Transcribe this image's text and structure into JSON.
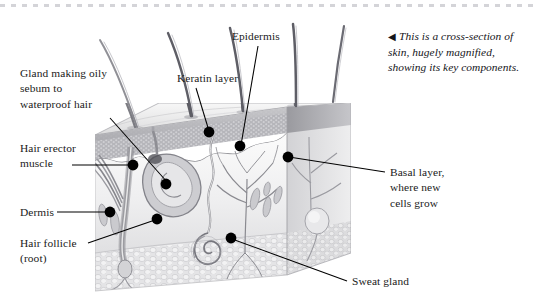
{
  "figure": {
    "title": "Cross-section of skin",
    "caption": {
      "arrow": "◀",
      "text": "This is a cross-section of skin, hugely magnified, showing its key components."
    },
    "labels": [
      {
        "id": "gland-sebum",
        "text": "Gland making oily\nsebum to\nwaterproof hair",
        "align": "left"
      },
      {
        "id": "hair-erector",
        "text": "Hair erector\nmuscle",
        "align": "left"
      },
      {
        "id": "dermis",
        "text": "Dermis",
        "align": "left"
      },
      {
        "id": "hair-follicle",
        "text": "Hair follicle\n(root)",
        "align": "left"
      },
      {
        "id": "keratin-layer",
        "text": "Keratin layer",
        "align": "left"
      },
      {
        "id": "epidermis",
        "text": "Epidermis",
        "align": "left"
      },
      {
        "id": "basal-layer",
        "text": "Basal layer,\nwhere new\ncells grow",
        "align": "left"
      },
      {
        "id": "sweat-gland",
        "text": "Sweat gland",
        "align": "left"
      }
    ],
    "colors": {
      "ink": "#1a1a1a",
      "leader": "#000000",
      "rule": "#d4d4d8",
      "epidermis": "#b9b9bd",
      "dermis": "#efefef",
      "fat": "#e2e2e4",
      "hair": "#8a8a8f",
      "page": "#ffffff"
    }
  }
}
